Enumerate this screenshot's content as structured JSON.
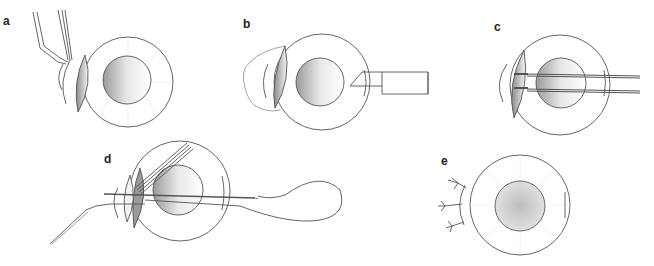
{
  "figure": {
    "panels": [
      {
        "id": "a",
        "label": "a",
        "description": "Forceps grasping conjunctiva / lens edge of eye"
      },
      {
        "id": "b",
        "label": "b",
        "description": "Eye with displaced lens and cannula/knife at right limbus"
      },
      {
        "id": "c",
        "label": "c",
        "description": "Two needles passed horizontally through the eye"
      },
      {
        "id": "d",
        "label": "d",
        "description": "Forceps with lens and suture loop passed through eye"
      },
      {
        "id": "e",
        "label": "e",
        "description": "Final eye with sutures tied at left and incision at right"
      }
    ],
    "colors": {
      "stroke": "#555555",
      "shade_dark": "#8a8a8a",
      "shade_light": "#e6e6e6",
      "pupil_center": "#c8c8c8",
      "background": "#ffffff"
    }
  }
}
